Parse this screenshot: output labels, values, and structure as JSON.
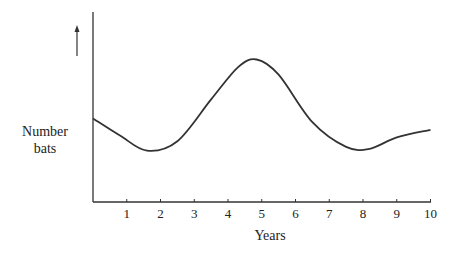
{
  "chart_data": {
    "type": "line",
    "title": "",
    "xlabel": "Years",
    "ylabel": "Number bats",
    "ylabel_lines": [
      "Number",
      "bats"
    ],
    "x_ticks": [
      "1",
      "2",
      "3",
      "4",
      "5",
      "6",
      "7",
      "8",
      "9",
      "10"
    ],
    "xlim": [
      0,
      10
    ],
    "y_ticks": [],
    "grid": false,
    "legend": null,
    "annotations": [
      "upward arrow next to y-axis label indicating increasing number"
    ],
    "series": [
      {
        "name": "Number of bats",
        "x": [
          0,
          0.8,
          1.6,
          2.5,
          3.5,
          4.3,
          4.85,
          5.5,
          6.5,
          7.5,
          8.2,
          9.0,
          10.0
        ],
        "y_relative": [
          44,
          35,
          27,
          32,
          54,
          71,
          75,
          67,
          42,
          29,
          28,
          34,
          38
        ]
      }
    ]
  }
}
